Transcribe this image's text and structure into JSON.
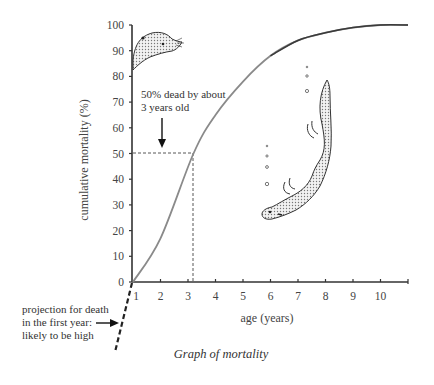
{
  "chart_data": {
    "type": "line",
    "title": "Graph of mortality",
    "xlabel": "age (years)",
    "ylabel": "cumulative mortality (%)",
    "x_ticks": [
      1,
      2,
      3,
      4,
      5,
      6,
      7,
      8,
      9,
      10
    ],
    "y_ticks": [
      0,
      10,
      20,
      30,
      40,
      50,
      60,
      70,
      80,
      90,
      100
    ],
    "xlim": [
      1,
      11
    ],
    "ylim": [
      0,
      100
    ],
    "grid": false,
    "series": [
      {
        "name": "cumulative mortality",
        "x": [
          1,
          2,
          3.2,
          4,
          5,
          6,
          7,
          8,
          9,
          10,
          11
        ],
        "values": [
          0,
          17,
          50,
          65,
          78,
          88,
          94,
          97,
          99,
          100,
          100
        ]
      },
      {
        "name": "projection for death in the first year",
        "style": "dashed",
        "x": [
          0,
          1
        ],
        "values": [
          -33,
          0
        ]
      }
    ],
    "annotations": [
      {
        "text": "50% dead by about 3 years old",
        "lines": [
          "50% dead by about",
          "3 years old"
        ],
        "points_to": {
          "x": 3.2,
          "y": 50
        }
      },
      {
        "text": "projection for death in the first year: likely to be high",
        "lines": [
          "projection for death",
          "in the first year:",
          "likely to be high"
        ]
      }
    ],
    "reference_lines": [
      {
        "type": "horizontal",
        "y": 50,
        "x_end": 3.2,
        "style": "dashed"
      },
      {
        "type": "vertical",
        "x": 3.2,
        "y_end": 50,
        "style": "dashed"
      }
    ],
    "illustrations": [
      "otter-head-icon",
      "diving-otter-icon",
      "air-bubbles-icon"
    ]
  },
  "colors": {
    "axis": "#333333",
    "curve": "#8a8a8a",
    "curve_dark": "#444444",
    "text": "#333333",
    "otter_fill": "#cfcfcf"
  }
}
